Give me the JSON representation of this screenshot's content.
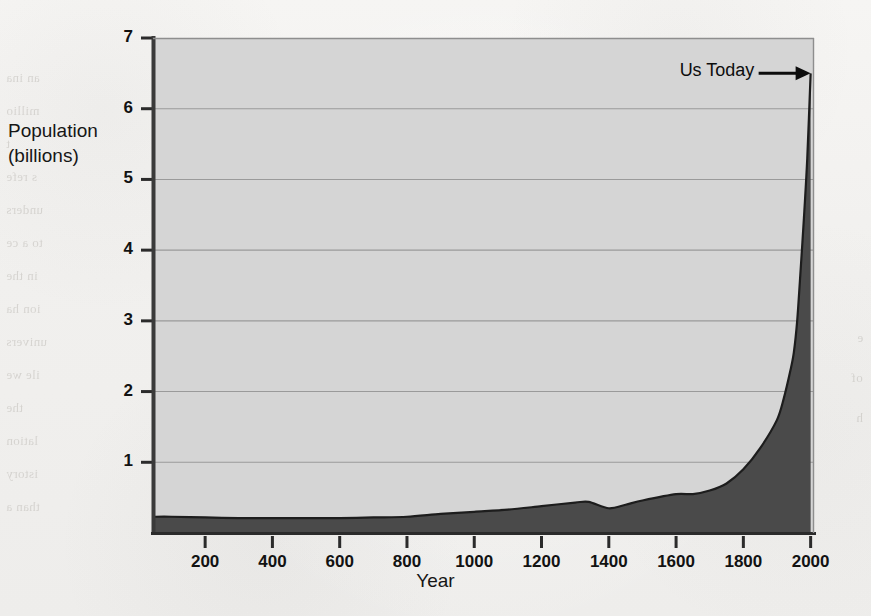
{
  "figure": {
    "background_color": "#f1f0ee",
    "plot_fill_color": "#d5d5d5",
    "area_fill_color": "#4a4a4a",
    "axis_color": "#2b2b2b",
    "gridline_color": "#9a9a9a"
  },
  "ghost_text": {
    "left_column": [
      "an ina",
      "millio",
      "t",
      "s refe",
      "unders",
      "to a ce",
      "in the",
      "ion ha",
      "univers",
      "ile we",
      "the",
      "lation",
      "istory",
      "than a"
    ],
    "right_column": [
      "e",
      "of",
      "h"
    ]
  },
  "chart_data": {
    "type": "area",
    "title": "",
    "xlabel": "Year",
    "ylabel": "Population\n(billions)",
    "ylabel_lines": [
      "Population",
      "(billions)"
    ],
    "xlim": [
      45,
      2010
    ],
    "ylim": [
      0,
      7
    ],
    "xticks": [
      200,
      400,
      600,
      800,
      1000,
      1200,
      1400,
      1600,
      1800,
      2000
    ],
    "xticklabels": [
      "200",
      "400",
      "600",
      "800",
      "1000",
      "1200",
      "1400",
      "1600",
      "1800",
      "2000"
    ],
    "yticks": [
      1,
      2,
      3,
      4,
      5,
      6,
      7
    ],
    "yticklabels": [
      "1",
      "2",
      "3",
      "4",
      "5",
      "6",
      "7"
    ],
    "grid": true,
    "grid_axis": "y",
    "legend": false,
    "x": [
      45,
      100,
      200,
      300,
      400,
      500,
      600,
      700,
      800,
      900,
      1000,
      1100,
      1200,
      1300,
      1340,
      1400,
      1450,
      1500,
      1600,
      1650,
      1700,
      1750,
      1800,
      1850,
      1900,
      1920,
      1940,
      1950,
      1960,
      1970,
      1980,
      1990,
      2000
    ],
    "y": [
      0.23,
      0.23,
      0.22,
      0.21,
      0.21,
      0.21,
      0.21,
      0.22,
      0.23,
      0.27,
      0.3,
      0.33,
      0.38,
      0.43,
      0.44,
      0.35,
      0.4,
      0.46,
      0.55,
      0.55,
      0.6,
      0.7,
      0.9,
      1.2,
      1.6,
      1.9,
      2.3,
      2.55,
      3.0,
      3.7,
      4.45,
      5.3,
      6.5
    ],
    "annotations": [
      {
        "text": "Us Today",
        "x": 1790,
        "y": 6.5,
        "arrow_to_x": 2000,
        "arrow_to_y": 6.5,
        "style": "arrow-right"
      }
    ]
  }
}
